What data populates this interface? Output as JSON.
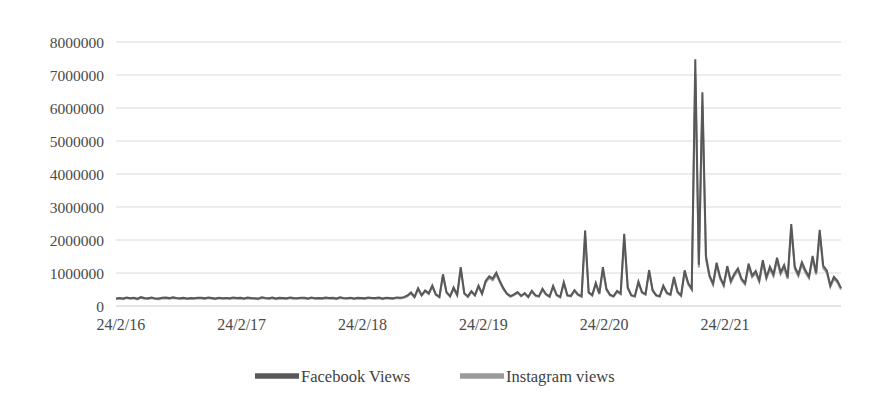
{
  "chart_data": {
    "type": "line",
    "title": "",
    "subtitle": "",
    "xlabel": "",
    "ylabel": "",
    "ylim": [
      0,
      8000000
    ],
    "xlim": [
      "24/2/16",
      "24/2/21"
    ],
    "grid": true,
    "legend_position": "bottom",
    "y_ticks": [
      0,
      1000000,
      2000000,
      3000000,
      4000000,
      5000000,
      6000000,
      7000000,
      8000000
    ],
    "y_tick_labels": [
      "0",
      "1000000",
      "2000000",
      "3000000",
      "4000000",
      "5000000",
      "6000000",
      "7000000",
      "8000000"
    ],
    "x_tick_labels": [
      "24/2/16",
      "24/2/17",
      "24/2/18",
      "24/2/19",
      "24/2/20",
      "24/2/21"
    ],
    "colors": {
      "facebook": "#585858",
      "instagram": "#9a9a9a",
      "gridline": "#d6d6d6",
      "text": "#4a4a4a",
      "background": "#ffffff"
    },
    "series": [
      {
        "name": "Facebook Views",
        "color": "#585858",
        "values": [
          230000,
          245000,
          228000,
          260000,
          238000,
          252000,
          222000,
          268000,
          240000,
          235000,
          258000,
          231000,
          226000,
          248000,
          256000,
          239000,
          261000,
          244000,
          233000,
          250000,
          229000,
          241000,
          236000,
          253000,
          247000,
          232000,
          259000,
          243000,
          227000,
          251000,
          237000,
          246000,
          234000,
          255000,
          242000,
          249000,
          230000,
          257000,
          241000,
          238000,
          225000,
          263000,
          246000,
          235000,
          254000,
          228000,
          249000,
          240000,
          232000,
          258000,
          243000,
          236000,
          251000,
          247000,
          229000,
          260000,
          238000,
          245000,
          233000,
          256000,
          241000,
          250000,
          227000,
          262000,
          244000,
          237000,
          253000,
          231000,
          248000,
          242000,
          234000,
          259000,
          246000,
          239000,
          255000,
          228000,
          252000,
          243000,
          236000,
          261000,
          250000,
          268000,
          320000,
          410000,
          280000,
          540000,
          330000,
          470000,
          390000,
          620000,
          350000,
          280000,
          960000,
          420000,
          300000,
          560000,
          340000,
          1180000,
          390000,
          290000,
          450000,
          330000,
          620000,
          380000,
          760000,
          900000,
          830000,
          1010000,
          760000,
          540000,
          380000,
          300000,
          350000,
          420000,
          310000,
          390000,
          280000,
          460000,
          330000,
          300000,
          520000,
          360000,
          290000,
          610000,
          340000,
          280000,
          720000,
          330000,
          310000,
          480000,
          350000,
          300000,
          2290000,
          420000,
          330000,
          700000,
          380000,
          1180000,
          520000,
          340000,
          300000,
          460000,
          380000,
          2190000,
          560000,
          330000,
          300000,
          740000,
          420000,
          360000,
          1090000,
          480000,
          330000,
          300000,
          620000,
          400000,
          350000,
          880000,
          430000,
          320000,
          1080000,
          700000,
          520000,
          7480000,
          1250000,
          6480000,
          1520000,
          930000,
          680000,
          1310000,
          870000,
          640000,
          1210000,
          760000,
          980000,
          1140000,
          830000,
          690000,
          1280000,
          920000,
          1060000,
          780000,
          1390000,
          870000,
          1190000,
          960000,
          1460000,
          1020000,
          1240000,
          870000,
          2480000,
          1190000,
          960000,
          1330000,
          1080000,
          890000,
          1520000,
          1010000,
          2310000,
          1220000,
          1080000,
          620000,
          880000,
          760000,
          540000
        ]
      },
      {
        "name": "Instagram views",
        "color": "#9a9a9a",
        "values": [
          210000,
          226000,
          208000,
          240000,
          218000,
          232000,
          202000,
          248000,
          220000,
          215000,
          238000,
          211000,
          206000,
          228000,
          236000,
          219000,
          241000,
          224000,
          213000,
          230000,
          209000,
          221000,
          216000,
          233000,
          227000,
          212000,
          239000,
          223000,
          207000,
          231000,
          217000,
          226000,
          214000,
          235000,
          222000,
          229000,
          210000,
          237000,
          221000,
          218000,
          205000,
          243000,
          226000,
          215000,
          234000,
          208000,
          229000,
          220000,
          212000,
          238000,
          223000,
          216000,
          231000,
          227000,
          209000,
          240000,
          218000,
          225000,
          213000,
          236000,
          221000,
          230000,
          207000,
          242000,
          224000,
          217000,
          233000,
          211000,
          228000,
          222000,
          214000,
          239000,
          226000,
          219000,
          235000,
          208000,
          232000,
          223000,
          216000,
          241000,
          230000,
          248000,
          290000,
          380000,
          260000,
          500000,
          310000,
          440000,
          360000,
          580000,
          330000,
          260000,
          900000,
          400000,
          280000,
          520000,
          320000,
          1100000,
          370000,
          270000,
          420000,
          310000,
          580000,
          360000,
          710000,
          850000,
          780000,
          950000,
          720000,
          510000,
          360000,
          280000,
          330000,
          400000,
          290000,
          370000,
          260000,
          430000,
          310000,
          280000,
          490000,
          340000,
          270000,
          570000,
          320000,
          260000,
          680000,
          310000,
          290000,
          450000,
          330000,
          280000,
          2080000,
          400000,
          310000,
          660000,
          360000,
          1090000,
          490000,
          320000,
          280000,
          430000,
          360000,
          2020000,
          530000,
          310000,
          280000,
          700000,
          400000,
          340000,
          1010000,
          450000,
          310000,
          280000,
          580000,
          380000,
          330000,
          820000,
          410000,
          300000,
          1010000,
          660000,
          490000,
          7020000,
          1170000,
          6080000,
          1420000,
          870000,
          640000,
          1230000,
          820000,
          600000,
          1140000,
          710000,
          920000,
          1070000,
          780000,
          650000,
          1200000,
          870000,
          990000,
          730000,
          1300000,
          820000,
          1120000,
          900000,
          1370000,
          960000,
          1160000,
          820000,
          2330000,
          1120000,
          900000,
          1250000,
          1010000,
          840000,
          1430000,
          950000,
          2170000,
          1150000,
          1010000,
          580000,
          830000,
          710000,
          500000
        ]
      }
    ]
  },
  "legend": {
    "items": [
      {
        "label": "Facebook Views",
        "color": "#585858"
      },
      {
        "label": "Instagram views",
        "color": "#9a9a9a"
      }
    ]
  }
}
